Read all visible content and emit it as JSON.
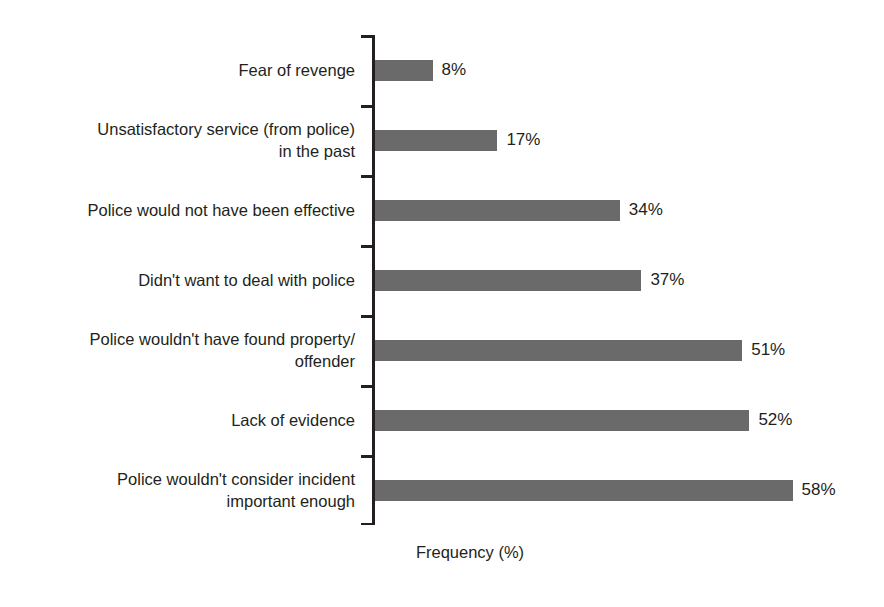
{
  "chart_data": {
    "type": "bar",
    "orientation": "horizontal",
    "title": "",
    "subtitle": "",
    "xlabel": "Frequency (%)",
    "ylabel": "",
    "xlim": [
      0,
      58
    ],
    "grid": false,
    "legend": null,
    "bar_color": "#6a6a6a",
    "text_color": "#231f20",
    "background_color": "#ffffff",
    "categories": [
      "Fear of revenge",
      "Unsatisfactory service (from police)\nin the past",
      "Police would not have been effective",
      "Didn't want to deal with police",
      "Police wouldn't have found property/\noffender",
      "Lack of evidence",
      "Police wouldn't consider incident\nimportant enough"
    ],
    "values": [
      8,
      17,
      34,
      37,
      51,
      52,
      58
    ],
    "value_labels": [
      "8%",
      "17%",
      "34%",
      "37%",
      "51%",
      "52%",
      "58%"
    ]
  }
}
